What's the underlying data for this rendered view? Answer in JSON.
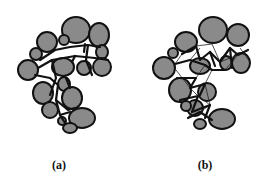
{
  "figure": {
    "panels": [
      {
        "id": "a",
        "label": "(a)",
        "label_pos": {
          "x": 59,
          "y": 158
        },
        "grain_fill": "#8a8a8a",
        "outline": "#111111",
        "grains": [
          {
            "cx": 76,
            "cy": 30,
            "rx": 14,
            "ry": 13
          },
          {
            "cx": 99,
            "cy": 35,
            "rx": 10,
            "ry": 12
          },
          {
            "cx": 47,
            "cy": 42,
            "rx": 10,
            "ry": 10
          },
          {
            "cx": 64,
            "cy": 40,
            "rx": 5,
            "ry": 5
          },
          {
            "cx": 102,
            "cy": 52,
            "rx": 6,
            "ry": 7
          },
          {
            "cx": 36,
            "cy": 54,
            "rx": 6,
            "ry": 6
          },
          {
            "cx": 28,
            "cy": 70,
            "rx": 10,
            "ry": 10
          },
          {
            "cx": 63,
            "cy": 67,
            "rx": 11,
            "ry": 9
          },
          {
            "cx": 84,
            "cy": 68,
            "rx": 7,
            "ry": 7
          },
          {
            "cx": 102,
            "cy": 67,
            "rx": 9,
            "ry": 9
          },
          {
            "cx": 64,
            "cy": 84,
            "rx": 6,
            "ry": 7
          },
          {
            "cx": 43,
            "cy": 93,
            "rx": 10,
            "ry": 11
          },
          {
            "cx": 72,
            "cy": 98,
            "rx": 10,
            "ry": 11
          },
          {
            "cx": 50,
            "cy": 110,
            "rx": 8,
            "ry": 8
          },
          {
            "cx": 82,
            "cy": 118,
            "rx": 13,
            "ry": 10
          },
          {
            "cx": 62,
            "cy": 121,
            "rx": 4,
            "ry": 4
          },
          {
            "cx": 70,
            "cy": 128,
            "rx": 7,
            "ry": 5
          }
        ],
        "bonds_thick": [
          [
            [
              40,
              60
            ],
            [
              55,
              50
            ],
            [
              70,
              47
            ],
            [
              88,
              45
            ],
            [
              100,
              47
            ]
          ],
          [
            [
              38,
              68
            ],
            [
              52,
              60
            ],
            [
              75,
              56
            ],
            [
              95,
              58
            ],
            [
              108,
              60
            ]
          ],
          [
            [
              35,
              75
            ],
            [
              50,
              78
            ],
            [
              58,
              85
            ],
            [
              56,
              100
            ],
            [
              60,
              115
            ],
            [
              65,
              123
            ]
          ],
          [
            [
              52,
              60
            ],
            [
              56,
              78
            ],
            [
              50,
              95
            ]
          ],
          [
            [
              75,
              56
            ],
            [
              72,
              62
            ]
          ],
          [
            [
              88,
              45
            ],
            [
              86,
              60
            ],
            [
              92,
              75
            ]
          ],
          [
            [
              66,
              78
            ],
            [
              70,
              88
            ]
          ],
          [
            [
              56,
              100
            ],
            [
              68,
              110
            ],
            [
              75,
              108
            ]
          ],
          [
            [
              60,
              115
            ],
            [
              70,
              112
            ]
          ],
          [
            [
              85,
              44
            ],
            [
              84,
              52
            ]
          ]
        ],
        "bonds_thin": []
      },
      {
        "id": "b",
        "label": "(b)",
        "label_pos": {
          "x": 205,
          "y": 158
        },
        "grain_fill": "#8a8a8a",
        "outline": "#111111",
        "grains": [
          {
            "cx": 213,
            "cy": 30,
            "rx": 14,
            "ry": 13
          },
          {
            "cx": 238,
            "cy": 35,
            "rx": 11,
            "ry": 11
          },
          {
            "cx": 186,
            "cy": 42,
            "rx": 11,
            "ry": 10
          },
          {
            "cx": 173,
            "cy": 53,
            "rx": 5,
            "ry": 5
          },
          {
            "cx": 164,
            "cy": 68,
            "rx": 11,
            "ry": 11
          },
          {
            "cx": 200,
            "cy": 66,
            "rx": 10,
            "ry": 8
          },
          {
            "cx": 226,
            "cy": 63,
            "rx": 6,
            "ry": 7
          },
          {
            "cx": 241,
            "cy": 63,
            "rx": 9,
            "ry": 10
          },
          {
            "cx": 180,
            "cy": 90,
            "rx": 11,
            "ry": 12
          },
          {
            "cx": 207,
            "cy": 92,
            "rx": 9,
            "ry": 9
          },
          {
            "cx": 195,
            "cy": 108,
            "rx": 8,
            "ry": 8
          },
          {
            "cx": 186,
            "cy": 106,
            "rx": 5,
            "ry": 5
          },
          {
            "cx": 222,
            "cy": 119,
            "rx": 13,
            "ry": 10
          },
          {
            "cx": 200,
            "cy": 124,
            "rx": 6,
            "ry": 5
          }
        ],
        "bonds_thick": [
          [
            [
              182,
              54
            ],
            [
              196,
              46
            ],
            [
              200,
              60
            ],
            [
              210,
              52
            ],
            [
              220,
              62
            ],
            [
              230,
              48
            ],
            [
              238,
              55
            ],
            [
              248,
              50
            ]
          ],
          [
            [
              175,
              64
            ],
            [
              190,
              60
            ],
            [
              205,
              65
            ],
            [
              212,
              70
            ],
            [
              225,
              70
            ]
          ],
          [
            [
              177,
              78
            ],
            [
              196,
              78
            ],
            [
              190,
              88
            ],
            [
              205,
              84
            ],
            [
              200,
              95
            ]
          ],
          [
            [
              180,
              100
            ],
            [
              198,
              96
            ],
            [
              192,
              112
            ],
            [
              210,
              105
            ],
            [
              205,
              118
            ]
          ],
          [
            [
              188,
              118
            ],
            [
              200,
              112
            ],
            [
              212,
              120
            ]
          ],
          [
            [
              210,
              52
            ],
            [
              215,
              66
            ]
          ],
          [
            [
              230,
              48
            ],
            [
              232,
              68
            ]
          ]
        ],
        "bonds_thin": [
          [
            [
              190,
              60
            ],
            [
              200,
              48
            ]
          ],
          [
            [
              196,
              46
            ],
            [
              212,
              44
            ]
          ],
          [
            [
              212,
              44
            ],
            [
              220,
              62
            ]
          ],
          [
            [
              205,
              65
            ],
            [
              196,
              78
            ]
          ],
          [
            [
              212,
              70
            ],
            [
              205,
              84
            ]
          ],
          [
            [
              190,
              88
            ],
            [
              198,
              96
            ]
          ],
          [
            [
              205,
              84
            ],
            [
              210,
              105
            ]
          ],
          [
            [
              198,
              96
            ],
            [
              210,
              105
            ]
          ],
          [
            [
              192,
              112
            ],
            [
              188,
              118
            ]
          ],
          [
            [
              200,
              112
            ],
            [
              210,
              105
            ]
          ],
          [
            [
              220,
              62
            ],
            [
              238,
              55
            ]
          ],
          [
            [
              225,
              70
            ],
            [
              238,
              55
            ]
          ],
          [
            [
              176,
              70
            ],
            [
              190,
              88
            ]
          ],
          [
            [
              182,
              54
            ],
            [
              175,
              64
            ]
          ],
          [
            [
              240,
              48
            ],
            [
              250,
              62
            ]
          ]
        ]
      }
    ]
  }
}
